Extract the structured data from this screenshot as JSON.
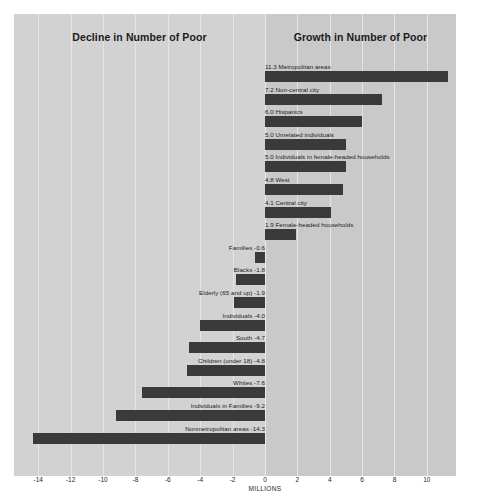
{
  "panels": {
    "left_title": "Decline in Number of Poor",
    "right_title": "Growth in Number of Poor"
  },
  "axis": {
    "unit_label": "MILLIONS",
    "ticks": [
      "-14",
      "-12",
      "-10",
      "-8",
      "-6",
      "-4",
      "-2",
      "0",
      "2",
      "4",
      "6",
      "8",
      "10"
    ]
  },
  "colors": {
    "bar": "#3a3a3a",
    "panel_left_bg": "#d2d2d2",
    "panel_right_bg": "#c9c9c9",
    "gridline": "#e4e4e4",
    "text": "#1b1b1b"
  },
  "chart_data": {
    "type": "bar",
    "orientation": "horizontal",
    "xlabel": "MILLIONS",
    "ylabel": "",
    "xlim": [
      -15.5,
      11.8
    ],
    "xticks": [
      -14,
      -12,
      -10,
      -8,
      -6,
      -4,
      -2,
      0,
      2,
      4,
      6,
      8,
      10
    ],
    "grid": true,
    "legend": "none",
    "categories": [
      "Metropolitan areas",
      "Non-central city",
      "Hispanics",
      "Unrelated individuals",
      "Individuals in female-headed households",
      "West",
      "Central city",
      "Female-headed households",
      "Families",
      "Blacks",
      "Elderly (65 and up)",
      "Individuals",
      "South",
      "Children (under 18)",
      "Whites",
      "Individuals in Families",
      "Nonmetropolitan areas"
    ],
    "values": [
      11.3,
      7.2,
      6.0,
      5.0,
      5.0,
      4.8,
      4.1,
      1.9,
      -0.6,
      -1.8,
      -1.9,
      -4.0,
      -4.7,
      -4.8,
      -7.6,
      -9.2,
      -14.3
    ],
    "bars": [
      {
        "label": "11.3 Metropolitan areas",
        "name": "Metropolitan areas",
        "value": 11.3
      },
      {
        "label": "7.2 Non-central city",
        "name": "Non-central city",
        "value": 7.2
      },
      {
        "label": "6.0 Hispanics",
        "name": "Hispanics",
        "value": 6.0
      },
      {
        "label": "5.0 Unrelated individuals",
        "name": "Unrelated individuals",
        "value": 5.0
      },
      {
        "label": "5.0 Individuals in female-headed households",
        "name": "Individuals in female-headed households",
        "value": 5.0
      },
      {
        "label": "4.8 West",
        "name": "West",
        "value": 4.8
      },
      {
        "label": "4.1 Central city",
        "name": "Central city",
        "value": 4.1
      },
      {
        "label": "1.9 Female-headed households",
        "name": "Female-headed households",
        "value": 1.9
      },
      {
        "label": "Families -0.6",
        "name": "Families",
        "value": -0.6
      },
      {
        "label": "Blacks -1.8",
        "name": "Blacks",
        "value": -1.8
      },
      {
        "label": "Elderly (65 and up) -1.9",
        "name": "Elderly (65 and up)",
        "value": -1.9
      },
      {
        "label": "Individuals -4.0",
        "name": "Individuals",
        "value": -4.0
      },
      {
        "label": "South -4.7",
        "name": "South",
        "value": -4.7
      },
      {
        "label": "Children (under 18) -4.8",
        "name": "Children (under 18)",
        "value": -4.8
      },
      {
        "label": "Whites -7.6",
        "name": "Whites",
        "value": -7.6
      },
      {
        "label": "Individuals in Families -9.2",
        "name": "Individuals in Families",
        "value": -9.2
      },
      {
        "label": "Nonmetropolitan areas -14.3",
        "name": "Nonmetropolitan areas",
        "value": -14.3
      }
    ]
  }
}
